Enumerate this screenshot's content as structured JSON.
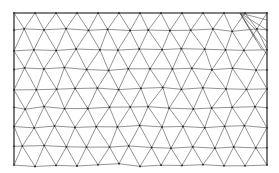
{
  "diagram": {
    "type": "triangular-mesh",
    "colors": {
      "background": "#ffffff",
      "edge": "#4a4a4a",
      "boundary": "#3a3a3a",
      "node": "#222222"
    },
    "boundary": {
      "left": 14,
      "right": 267,
      "top": 13,
      "bottom": 165
    },
    "grid": {
      "row_ys": [
        13,
        30,
        50,
        69,
        89,
        108,
        127,
        147,
        165
      ],
      "dx": 21,
      "row_offsets": [
        0,
        10,
        0,
        10,
        0,
        10,
        0,
        10,
        0
      ],
      "x_start": 14
    },
    "corner_fan": {
      "apex": [
        240,
        13
      ],
      "targets": [
        [
          267,
          30
        ],
        [
          267,
          42
        ],
        [
          267,
          55
        ],
        [
          267,
          20
        ],
        [
          262,
          50
        ],
        [
          256,
          40
        ]
      ]
    }
  }
}
